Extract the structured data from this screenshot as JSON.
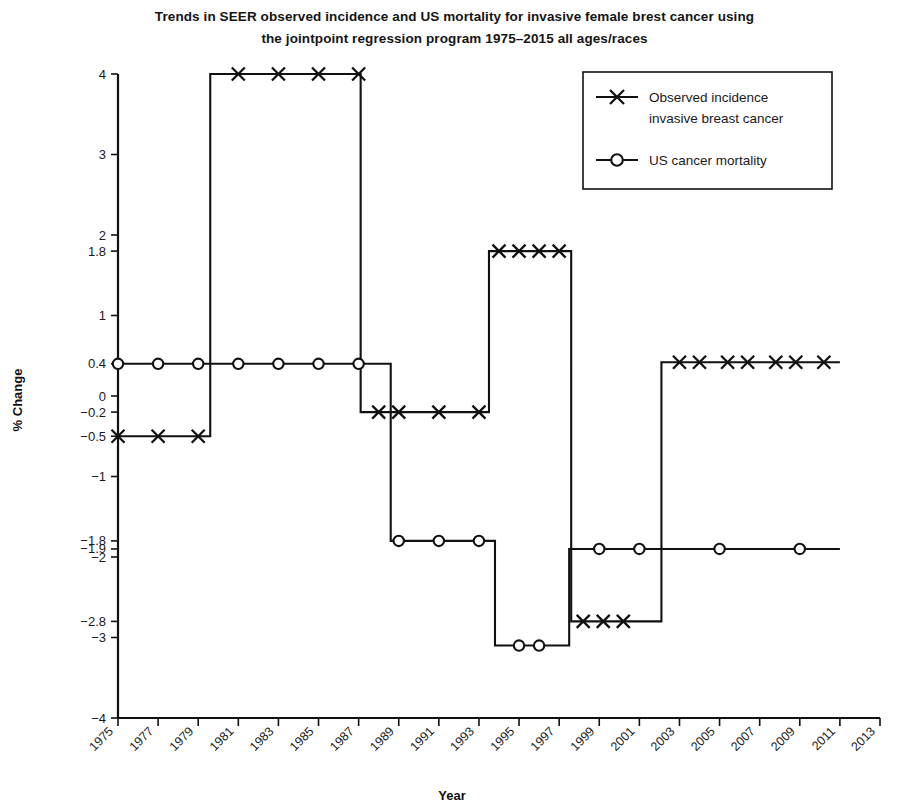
{
  "chart_data": {
    "type": "line",
    "title": "Trends in SEER observed incidence and US mortality for invasive female brest cancer using the jointpoint regression program 1975–2015 all ages/races",
    "title_lines": [
      "Trends in SEER observed incidence and US mortality for invasive female brest cancer using",
      "the jointpoint regression program 1975–2015 all ages/races"
    ],
    "xlabel": "Year",
    "ylabel": "% Change",
    "xlim": [
      1975,
      2013
    ],
    "ylim": [
      -4,
      4
    ],
    "grid": false,
    "legend_position": "top-right",
    "x_tick_labels": [
      "1975",
      "1977",
      "1979",
      "1981",
      "1983",
      "1985",
      "1987",
      "1989",
      "1991",
      "1993",
      "1995",
      "1997",
      "1999",
      "2001",
      "2003",
      "2005",
      "2007",
      "2009",
      "2011",
      "2013"
    ],
    "x_tick_values": [
      1975,
      1977,
      1979,
      1981,
      1983,
      1985,
      1987,
      1989,
      1991,
      1993,
      1995,
      1997,
      1999,
      2001,
      2003,
      2005,
      2007,
      2009,
      2011,
      2013
    ],
    "y_tick_labels": [
      "4",
      "3",
      "2",
      "1.8",
      "1",
      "0.4",
      "0",
      "-0.2",
      "-0.5",
      "-1",
      "-1.8",
      "-1.9",
      "-2",
      "-2.8",
      "-3",
      "-4"
    ],
    "y_tick_values": [
      4,
      3,
      2,
      1.8,
      1,
      0.4,
      0,
      -0.2,
      -0.5,
      -1,
      -1.8,
      -1.9,
      -2,
      -2.8,
      -3,
      -4
    ],
    "series": [
      {
        "name": "Observed incidence invasive breast cancer",
        "marker": "x",
        "segments": [
          {
            "x_start": 1975,
            "x_end": 1979.6,
            "value": -0.5
          },
          {
            "x_start": 1979.6,
            "x_end": 1987.1,
            "value": 4.0
          },
          {
            "x_start": 1987.1,
            "x_end": 1993.5,
            "value": -0.2
          },
          {
            "x_start": 1993.5,
            "x_end": 1997.6,
            "value": 1.8
          },
          {
            "x_start": 1997.6,
            "x_end": 2002.1,
            "value": -2.8
          },
          {
            "x_start": 2002.1,
            "x_end": 2011.0,
            "value": 0.42
          }
        ],
        "marker_points": [
          {
            "x": 1975,
            "y": -0.5
          },
          {
            "x": 1977,
            "y": -0.5
          },
          {
            "x": 1979,
            "y": -0.5
          },
          {
            "x": 1981,
            "y": 4.0
          },
          {
            "x": 1983,
            "y": 4.0
          },
          {
            "x": 1985,
            "y": 4.0
          },
          {
            "x": 1987,
            "y": 4.0
          },
          {
            "x": 1988,
            "y": -0.2
          },
          {
            "x": 1989,
            "y": -0.2
          },
          {
            "x": 1991,
            "y": -0.2
          },
          {
            "x": 1993,
            "y": -0.2
          },
          {
            "x": 1994,
            "y": 1.8
          },
          {
            "x": 1995,
            "y": 1.8
          },
          {
            "x": 1996,
            "y": 1.8
          },
          {
            "x": 1997,
            "y": 1.8
          },
          {
            "x": 1998.2,
            "y": -2.8
          },
          {
            "x": 1999.2,
            "y": -2.8
          },
          {
            "x": 2000.2,
            "y": -2.8
          },
          {
            "x": 2003,
            "y": 0.42
          },
          {
            "x": 2004,
            "y": 0.42
          },
          {
            "x": 2005.4,
            "y": 0.42
          },
          {
            "x": 2006.4,
            "y": 0.42
          },
          {
            "x": 2007.8,
            "y": 0.42
          },
          {
            "x": 2008.8,
            "y": 0.42
          },
          {
            "x": 2010.2,
            "y": 0.42
          }
        ]
      },
      {
        "name": "US cancer mortality",
        "marker": "o",
        "segments": [
          {
            "x_start": 1975,
            "x_end": 1988.6,
            "value": 0.4
          },
          {
            "x_start": 1988.6,
            "x_end": 1993.8,
            "value": -1.8
          },
          {
            "x_start": 1993.8,
            "x_end": 1997.5,
            "value": -3.1
          },
          {
            "x_start": 1997.5,
            "x_end": 2011.0,
            "value": -1.9
          }
        ],
        "marker_points": [
          {
            "x": 1975,
            "y": 0.4
          },
          {
            "x": 1977,
            "y": 0.4
          },
          {
            "x": 1979,
            "y": 0.4
          },
          {
            "x": 1981,
            "y": 0.4
          },
          {
            "x": 1983,
            "y": 0.4
          },
          {
            "x": 1985,
            "y": 0.4
          },
          {
            "x": 1987,
            "y": 0.4
          },
          {
            "x": 1989,
            "y": -1.8
          },
          {
            "x": 1991,
            "y": -1.8
          },
          {
            "x": 1993,
            "y": -1.8
          },
          {
            "x": 1995,
            "y": -3.1
          },
          {
            "x": 1996,
            "y": -3.1
          },
          {
            "x": 1999,
            "y": -1.9
          },
          {
            "x": 2001,
            "y": -1.9
          },
          {
            "x": 2005,
            "y": -1.9
          },
          {
            "x": 2009,
            "y": -1.9
          }
        ]
      }
    ],
    "legend": [
      {
        "label_lines": [
          "Observed incidence",
          "invasive breast cancer"
        ],
        "marker": "x"
      },
      {
        "label_lines": [
          "US cancer mortality"
        ],
        "marker": "o"
      }
    ],
    "colors": {
      "line": "#111111",
      "text": "#1a1a1a",
      "background": "#ffffff"
    }
  }
}
